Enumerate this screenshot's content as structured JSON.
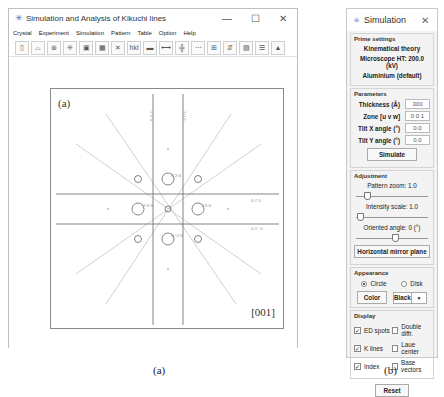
{
  "main_window": {
    "title": "Simulation and Analysis of Kikuchi lines",
    "controls": {
      "minimize": "—",
      "maximize": "☐",
      "close": "✕"
    },
    "menu": [
      "Crystal",
      "Experiment",
      "Simulation",
      "Pattern",
      "Table",
      "Option",
      "Help"
    ],
    "toolbar_icons": [
      "new-file-icon",
      "open-folder-icon",
      "crystal-icon",
      "lattice-icon",
      "frame-icon",
      "grid-icon",
      "kikuchi-icon",
      "hkl-label-icon",
      "line-icon",
      "spacing-icon",
      "cross-grid-icon",
      "dots-icon",
      "ruler-icon",
      "zoom-icon",
      "export-icon",
      "database-icon",
      "lock-icon"
    ],
    "toolbar_glyphs": [
      "▯",
      "⌓",
      "⊛",
      "⁜",
      "▣",
      "▦",
      "✕",
      "hkl",
      "▬",
      "⟷",
      "╬",
      "⋯",
      "⊞",
      "⇵",
      "▨",
      "☰",
      "▲"
    ],
    "pattern": {
      "panel_label": "(a)",
      "zone_label": "[001]",
      "spot_labels": [
        "0 2 0",
        "2 0 0",
        "-2 0 0",
        "0 -2 0"
      ],
      "line_labels": [
        "2 0 0",
        "-2 0 0",
        "0 2 0",
        "0 -2 0"
      ]
    }
  },
  "sim_panel": {
    "title": "Simulation",
    "close": "✕",
    "prime_settings": {
      "label": "Prime settings",
      "theory": "Kinematical theory",
      "microscope": "Microscope HT: 200.0 (kV)",
      "material": "Aluminium (default)"
    },
    "parameters": {
      "label": "Parameters",
      "fields": [
        {
          "label": "Thickness (Å)",
          "value": "300"
        },
        {
          "label": "Zone [u v w]",
          "value": "0 0 1"
        },
        {
          "label": "Tilt X angle (°)",
          "value": "0.0"
        },
        {
          "label": "Tilt Y angle (°)",
          "value": "0.0"
        }
      ],
      "simulate_button": "Simulate"
    },
    "adjustment": {
      "label": "Adjustment",
      "pattern_zoom": "Pattern zoom: 1.0",
      "intensity_scale": "Intensity scale: 1.0",
      "oriented_angle": "Oriented angle: 0 (°)",
      "mirror_button": "Horizontal mirror plane"
    },
    "appearance": {
      "label": "Appearance",
      "radio_circle": "Circle",
      "radio_disk": "Disk",
      "color_button": "Color",
      "color_select": "Black",
      "select_arrow": "▼"
    },
    "display": {
      "label": "Display",
      "checks": [
        {
          "label": "ED spots",
          "checked": true
        },
        {
          "label": "Double diffr.",
          "checked": false
        },
        {
          "label": "K lines",
          "checked": true
        },
        {
          "label": "Laue center",
          "checked": false
        },
        {
          "label": "Index",
          "checked": true
        },
        {
          "label": "Base vectors",
          "checked": false
        }
      ],
      "check_mark": "✓"
    },
    "reset_button": "Reset"
  },
  "captions": {
    "left": "(a)",
    "right": "(b)"
  }
}
